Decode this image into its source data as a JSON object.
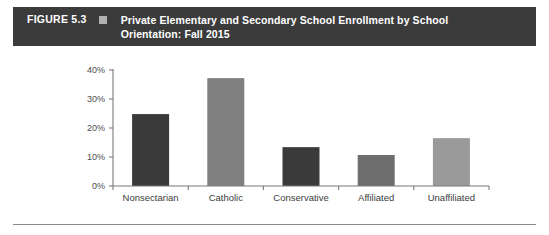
{
  "header": {
    "figure_number": "FIGURE 5.3",
    "marker_icon": "square-marker-icon",
    "title_line1": "Private Elementary and Secondary School Enrollment by School",
    "title_line2": "Orientation: Fall 2015",
    "background_color": "#3b3b3b",
    "text_color": "#ffffff",
    "marker_color": "#b0b0b0"
  },
  "chart_data": {
    "type": "bar",
    "title": "Private Elementary and Secondary School Enrollment by School Orientation: Fall 2015",
    "xlabel": "",
    "ylabel": "",
    "categories": [
      "Nonsectarian",
      "Catholic",
      "Conservative Christian",
      "Affiliated Religious",
      "Unaffiliated Religious"
    ],
    "category_lines": [
      [
        "Nonsectarian"
      ],
      [
        "Catholic"
      ],
      [
        "Conservative",
        "Christian"
      ],
      [
        "Affiliated",
        "Religious"
      ],
      [
        "Unaffiliated",
        "Religious"
      ]
    ],
    "values": [
      24.8,
      37.2,
      13.4,
      10.7,
      16.5
    ],
    "value_labels": [
      "24.8%",
      "37.2%",
      "13.4%",
      "10.7%",
      "16.5%"
    ],
    "bar_colors": [
      "#3a3a3a",
      "#808080",
      "#3a3a3a",
      "#6e6e6e",
      "#9a9a9a"
    ],
    "ylim": [
      0,
      40
    ],
    "yticks": [
      0,
      10,
      20,
      30,
      40
    ],
    "ytick_labels": [
      "0%",
      "10%",
      "20%",
      "30%",
      "40%"
    ],
    "grid": false,
    "legend": null,
    "axis_color": "#7a7a7a"
  },
  "footer": {
    "rule_color": "#8a8a8a"
  }
}
